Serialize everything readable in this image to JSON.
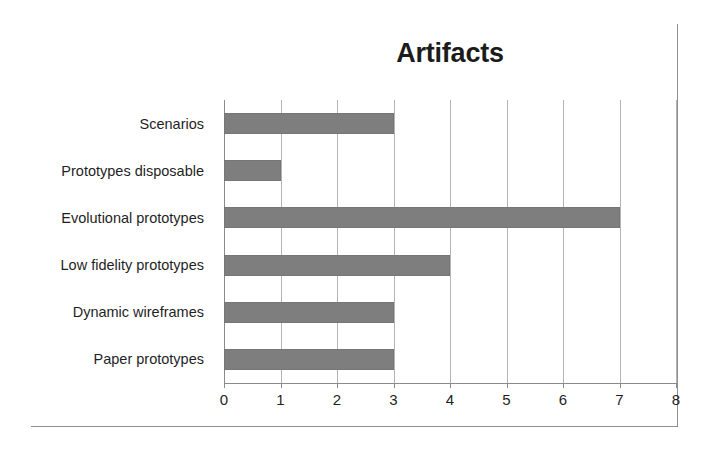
{
  "chart_data": {
    "type": "bar",
    "orientation": "horizontal",
    "title": "Artifacts",
    "xlabel": "",
    "ylabel": "",
    "categories": [
      "Scenarios",
      "Prototypes disposable",
      "Evolutional prototypes",
      "Low fidelity prototypes",
      "Dynamic wireframes",
      "Paper prototypes"
    ],
    "values": [
      3,
      1,
      7,
      4,
      3,
      3
    ],
    "xlim": [
      0,
      8
    ],
    "xticks": [
      "0",
      "1",
      "2",
      "3",
      "4",
      "5",
      "6",
      "7",
      "8"
    ],
    "grid": "vertical",
    "legend": "none",
    "colors": {
      "bar": "#7e7e7e",
      "gridline": "#b4b4b4",
      "axis": "#8a8a8a",
      "text": "#1f1f1f",
      "title": "#1b1b1b",
      "background": "#ffffff",
      "frame_border": "#8f8f8f"
    }
  }
}
